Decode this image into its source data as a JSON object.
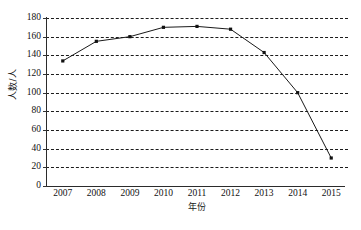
{
  "chart_data": {
    "type": "line",
    "title": "",
    "xlabel": "年份",
    "ylabel": "人数/人",
    "categories": [
      "2007",
      "2008",
      "2009",
      "2010",
      "2011",
      "2012",
      "2013",
      "2014",
      "2015"
    ],
    "values": [
      134,
      155,
      160,
      170,
      171,
      168,
      143,
      100,
      30
    ],
    "series": [
      {
        "name": "人数/人",
        "values": [
          134,
          155,
          160,
          170,
          171,
          168,
          143,
          100,
          30
        ]
      }
    ],
    "ylim": [
      0,
      180
    ],
    "yticks": [
      0,
      20,
      40,
      60,
      80,
      100,
      120,
      140,
      160,
      180
    ],
    "ytick_labels": [
      "0",
      "20",
      "40",
      "60",
      "80",
      "100",
      "120",
      "140",
      "160",
      "180"
    ],
    "xlim": [
      "2007",
      "2015"
    ],
    "grid": "horizontal-dashed",
    "legend": "none",
    "marker": "square",
    "line_color": "#1a1a1a",
    "marker_color": "#111111",
    "grid_color": "#1b1b1b",
    "axis_color": "#2b2b2b",
    "background_color": "#ffffff"
  }
}
